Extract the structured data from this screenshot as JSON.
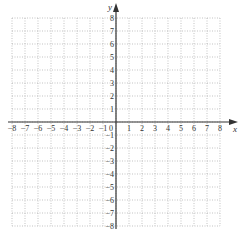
{
  "chart_data": {
    "type": "scatter",
    "title": "",
    "xlabel": "x",
    "ylabel": "y",
    "xlim": [
      -8,
      8
    ],
    "ylim": [
      -8,
      8
    ],
    "grid": true,
    "grid_style": "dotted",
    "x_ticks": [
      -8,
      -7,
      -6,
      -5,
      -4,
      -3,
      -2,
      -1,
      1,
      2,
      3,
      4,
      5,
      6,
      7,
      8
    ],
    "y_ticks": [
      -8,
      -7,
      -6,
      -5,
      -4,
      -3,
      -2,
      -1,
      1,
      2,
      3,
      4,
      5,
      6,
      7,
      8
    ],
    "origin_label": "0",
    "series": []
  },
  "labels": {
    "x_axis": "x",
    "y_axis": "y",
    "origin": "0"
  },
  "colors": {
    "axis": "#333333",
    "grid": "#9a9a9a",
    "text": "#333333"
  }
}
